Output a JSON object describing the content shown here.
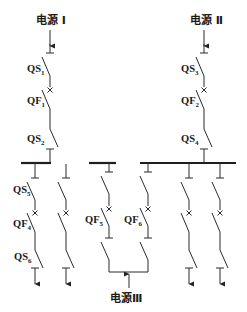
{
  "diagram": {
    "title": "",
    "sources": [
      {
        "id": "src1",
        "label": "电源 Ⅰ"
      },
      {
        "id": "src2",
        "label": "电源 Ⅱ"
      },
      {
        "id": "src3",
        "label": "电源Ⅲ"
      }
    ],
    "devices": [
      {
        "id": "QS1",
        "base": "QS",
        "sub": "1"
      },
      {
        "id": "QF1",
        "base": "QF",
        "sub": "1"
      },
      {
        "id": "QS2",
        "base": "QS",
        "sub": "2"
      },
      {
        "id": "QS3",
        "base": "QS",
        "sub": "3"
      },
      {
        "id": "QF2",
        "base": "QF",
        "sub": "2"
      },
      {
        "id": "QS4",
        "base": "QS",
        "sub": "4"
      },
      {
        "id": "QS5",
        "base": "QS",
        "sub": "5"
      },
      {
        "id": "QF4",
        "base": "QF",
        "sub": "4"
      },
      {
        "id": "QS6",
        "base": "QS",
        "sub": "6"
      },
      {
        "id": "QF5",
        "base": "QF",
        "sub": "5"
      },
      {
        "id": "QF6",
        "base": "QF",
        "sub": "6"
      }
    ]
  }
}
